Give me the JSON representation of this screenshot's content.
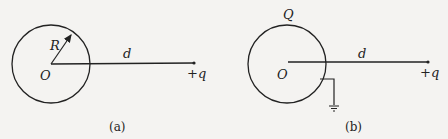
{
  "figures": [
    {
      "id": "a",
      "caption": "(a)",
      "labels": {
        "center": "O",
        "radius": "R",
        "distance": "d",
        "charge": "+q"
      }
    },
    {
      "id": "b",
      "caption": "(b)",
      "labels": {
        "sphere_charge": "Q",
        "center": "O",
        "distance": "d",
        "charge": "+q"
      },
      "grounded": true
    }
  ],
  "colors": {
    "ink": "#222222",
    "background": "#f4f3f1"
  }
}
